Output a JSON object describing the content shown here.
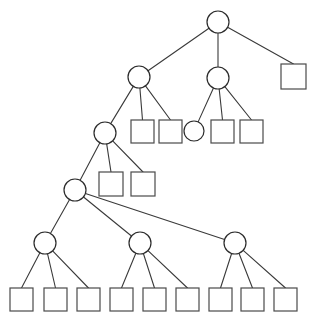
{
  "diagram": {
    "type": "tree",
    "background_color": "#ffffff",
    "node_fill_color": "#ffffff",
    "circle_stroke_color": "#2b2b2b",
    "square_stroke_color": "#4a4a4a",
    "edge_color": "#3a3a3a",
    "edge_width": 1.1,
    "canvas": {
      "width": 310,
      "height": 319
    },
    "counts": {
      "circles": 9,
      "squares": 18,
      "total_nodes": 27,
      "edges": 26,
      "depth": 6
    },
    "nodes": [
      {
        "id": "n0",
        "shape": "circle",
        "cx": 218,
        "cy": 22,
        "r": 11,
        "level": 0,
        "label": ""
      },
      {
        "id": "n1",
        "shape": "circle",
        "cx": 139,
        "cy": 77,
        "r": 11,
        "level": 1,
        "label": ""
      },
      {
        "id": "n2",
        "shape": "circle",
        "cx": 218,
        "cy": 78,
        "r": 11,
        "level": 1,
        "label": ""
      },
      {
        "id": "n3",
        "shape": "square",
        "x": 281,
        "y": 64,
        "w": 25,
        "h": 25,
        "level": 1,
        "label": ""
      },
      {
        "id": "n4",
        "shape": "circle",
        "cx": 105,
        "cy": 133,
        "r": 11,
        "level": 2,
        "label": ""
      },
      {
        "id": "n5",
        "shape": "square",
        "x": 131,
        "y": 120,
        "w": 23,
        "h": 23,
        "level": 2,
        "label": ""
      },
      {
        "id": "n6",
        "shape": "square",
        "x": 159,
        "y": 120,
        "w": 23,
        "h": 23,
        "level": 2,
        "label": ""
      },
      {
        "id": "n7",
        "shape": "circle",
        "cx": 194,
        "cy": 131,
        "r": 10,
        "level": 2,
        "label": ""
      },
      {
        "id": "n8",
        "shape": "square",
        "x": 211,
        "y": 120,
        "w": 23,
        "h": 23,
        "level": 2,
        "label": ""
      },
      {
        "id": "n9",
        "shape": "square",
        "x": 240,
        "y": 120,
        "w": 23,
        "h": 23,
        "level": 2,
        "label": ""
      },
      {
        "id": "n10",
        "shape": "circle",
        "cx": 75,
        "cy": 190,
        "r": 11,
        "level": 3,
        "label": ""
      },
      {
        "id": "n11",
        "shape": "square",
        "x": 99,
        "y": 172,
        "w": 24,
        "h": 24,
        "level": 3,
        "label": ""
      },
      {
        "id": "n12",
        "shape": "square",
        "x": 131,
        "y": 172,
        "w": 24,
        "h": 24,
        "level": 3,
        "label": ""
      },
      {
        "id": "n13",
        "shape": "circle",
        "cx": 45,
        "cy": 243,
        "r": 11,
        "level": 4,
        "label": ""
      },
      {
        "id": "n14",
        "shape": "circle",
        "cx": 140,
        "cy": 243,
        "r": 11,
        "level": 4,
        "label": ""
      },
      {
        "id": "n15",
        "shape": "circle",
        "cx": 235,
        "cy": 243,
        "r": 11,
        "level": 4,
        "label": ""
      },
      {
        "id": "n16",
        "shape": "square",
        "x": 10,
        "y": 288,
        "w": 23,
        "h": 23,
        "level": 5,
        "label": ""
      },
      {
        "id": "n17",
        "shape": "square",
        "x": 44,
        "y": 288,
        "w": 23,
        "h": 23,
        "level": 5,
        "label": ""
      },
      {
        "id": "n18",
        "shape": "square",
        "x": 77,
        "y": 288,
        "w": 23,
        "h": 23,
        "level": 5,
        "label": ""
      },
      {
        "id": "n19",
        "shape": "square",
        "x": 110,
        "y": 288,
        "w": 23,
        "h": 23,
        "level": 5,
        "label": ""
      },
      {
        "id": "n20",
        "shape": "square",
        "x": 143,
        "y": 288,
        "w": 23,
        "h": 23,
        "level": 5,
        "label": ""
      },
      {
        "id": "n21",
        "shape": "square",
        "x": 176,
        "y": 288,
        "w": 23,
        "h": 23,
        "level": 5,
        "label": ""
      },
      {
        "id": "n22",
        "shape": "square",
        "x": 209,
        "y": 288,
        "w": 23,
        "h": 23,
        "level": 5,
        "label": ""
      },
      {
        "id": "n23",
        "shape": "square",
        "x": 241,
        "y": 288,
        "w": 23,
        "h": 23,
        "level": 5,
        "label": ""
      },
      {
        "id": "n24",
        "shape": "square",
        "x": 274,
        "y": 288,
        "w": 23,
        "h": 23,
        "level": 5,
        "label": ""
      }
    ],
    "edges": [
      {
        "from": "n0",
        "to": "n1"
      },
      {
        "from": "n0",
        "to": "n2"
      },
      {
        "from": "n0",
        "to": "n3"
      },
      {
        "from": "n1",
        "to": "n4"
      },
      {
        "from": "n1",
        "to": "n5"
      },
      {
        "from": "n1",
        "to": "n6"
      },
      {
        "from": "n2",
        "to": "n7"
      },
      {
        "from": "n2",
        "to": "n8"
      },
      {
        "from": "n2",
        "to": "n9"
      },
      {
        "from": "n4",
        "to": "n10"
      },
      {
        "from": "n4",
        "to": "n11"
      },
      {
        "from": "n4",
        "to": "n12"
      },
      {
        "from": "n10",
        "to": "n13"
      },
      {
        "from": "n10",
        "to": "n14"
      },
      {
        "from": "n10",
        "to": "n15"
      },
      {
        "from": "n13",
        "to": "n16"
      },
      {
        "from": "n13",
        "to": "n17"
      },
      {
        "from": "n13",
        "to": "n18"
      },
      {
        "from": "n14",
        "to": "n19"
      },
      {
        "from": "n14",
        "to": "n20"
      },
      {
        "from": "n14",
        "to": "n21"
      },
      {
        "from": "n15",
        "to": "n22"
      },
      {
        "from": "n15",
        "to": "n23"
      },
      {
        "from": "n15",
        "to": "n24"
      }
    ]
  }
}
